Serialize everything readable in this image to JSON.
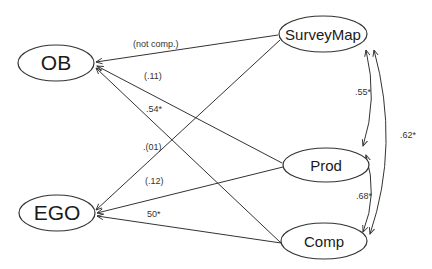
{
  "diagram": {
    "type": "path-diagram",
    "nodes": {
      "ob": {
        "label": "OB"
      },
      "ego": {
        "label": "EGO"
      },
      "surveymap": {
        "label": "SurveyMap"
      },
      "prod": {
        "label": "Prod"
      },
      "comp": {
        "label": "Comp"
      }
    },
    "paths": {
      "surveymap_ob": {
        "from": "SurveyMap",
        "to": "OB",
        "label": "(not comp.)"
      },
      "prod_ob": {
        "from": "Prod",
        "to": "OB",
        "label": "(.11)"
      },
      "comp_ob": {
        "from": "Comp",
        "to": "OB",
        "label": ".54*"
      },
      "surveymap_ego": {
        "from": "SurveyMap",
        "to": "EGO",
        "label": ".(01)"
      },
      "prod_ego": {
        "from": "Prod",
        "to": "EGO",
        "label": "(.12)"
      },
      "comp_ego": {
        "from": "Comp",
        "to": "EGO",
        "label": "50*"
      }
    },
    "correlations": {
      "surveymap_prod": {
        "between": [
          "SurveyMap",
          "Prod"
        ],
        "label": ".55*"
      },
      "prod_comp": {
        "between": [
          "Prod",
          "Comp"
        ],
        "label": ".68*"
      },
      "surveymap_comp": {
        "between": [
          "SurveyMap",
          "Comp"
        ],
        "label": ".62*"
      }
    }
  }
}
